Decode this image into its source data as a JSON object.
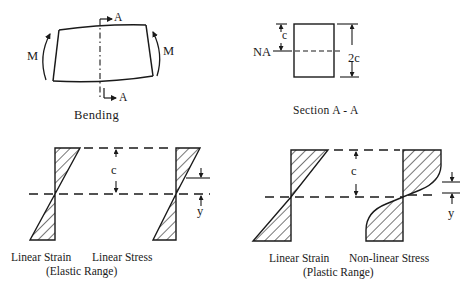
{
  "bending": {
    "moment_left": "M",
    "moment_right": "M",
    "section_top": "A",
    "section_bottom": "A",
    "caption": "Bending"
  },
  "section": {
    "neutral_axis": "NA",
    "half_depth": "c",
    "full_depth": "2c",
    "caption": "Section A - A"
  },
  "elastic": {
    "strain_label": "Linear Strain",
    "stress_label": "Linear Stress",
    "range_label": "(Elastic Range)",
    "c_label": "c",
    "y_label": "y"
  },
  "plastic": {
    "strain_label": "Linear Strain",
    "stress_label": "Non-linear Stress",
    "range_label": "(Plastic Range)",
    "c_label": "c",
    "y_label": "y"
  },
  "colors": {
    "ink": "#1a1a1a",
    "background": "#ffffff"
  }
}
